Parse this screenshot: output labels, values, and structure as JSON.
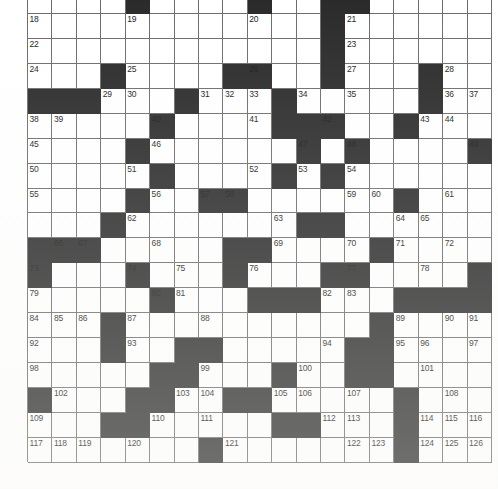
{
  "document": {
    "kind": "crossword-puzzle-grid",
    "title": "Crossword Puzzle Grid",
    "columns": 19,
    "rows": 19,
    "first_row_clipped": true,
    "colors": {
      "block": "#2b2b2b",
      "cell": "#ffffff",
      "rule": "#6d6d6d",
      "number_text": "#1b1b1b",
      "page_background": "#ffffff"
    },
    "number_range": {
      "lowest_visible": 18,
      "highest_visible": 130
    }
  },
  "grid": {
    "legend": {
      "0": "white / open cell",
      "1": "black / blocked cell"
    },
    "blocks": [
      [
        0,
        0,
        0,
        0,
        1,
        0,
        0,
        0,
        0,
        1,
        0,
        0,
        1,
        1,
        0,
        0,
        0,
        0,
        0
      ],
      [
        0,
        0,
        0,
        0,
        0,
        0,
        0,
        0,
        0,
        0,
        0,
        0,
        1,
        0,
        0,
        0,
        0,
        0,
        0
      ],
      [
        0,
        0,
        0,
        0,
        0,
        0,
        0,
        0,
        0,
        0,
        0,
        0,
        1,
        0,
        0,
        0,
        0,
        0,
        0
      ],
      [
        0,
        0,
        0,
        1,
        0,
        0,
        0,
        0,
        1,
        1,
        0,
        0,
        1,
        0,
        0,
        0,
        1,
        0,
        0
      ],
      [
        1,
        1,
        1,
        0,
        0,
        0,
        1,
        0,
        0,
        0,
        1,
        0,
        0,
        0,
        0,
        0,
        1,
        0,
        0
      ],
      [
        0,
        0,
        0,
        0,
        0,
        1,
        0,
        0,
        0,
        0,
        1,
        1,
        1,
        0,
        0,
        1,
        0,
        0,
        0
      ],
      [
        0,
        0,
        0,
        0,
        1,
        0,
        0,
        0,
        0,
        0,
        0,
        1,
        0,
        1,
        0,
        0,
        0,
        0,
        1
      ],
      [
        0,
        0,
        0,
        0,
        0,
        1,
        0,
        0,
        0,
        0,
        1,
        0,
        1,
        0,
        0,
        0,
        0,
        0,
        0
      ],
      [
        0,
        0,
        0,
        0,
        1,
        0,
        0,
        1,
        1,
        0,
        0,
        0,
        0,
        0,
        0,
        1,
        0,
        0,
        0
      ],
      [
        0,
        0,
        0,
        1,
        0,
        0,
        0,
        0,
        0,
        0,
        0,
        1,
        1,
        0,
        0,
        0,
        0,
        0,
        0
      ],
      [
        1,
        1,
        1,
        0,
        0,
        0,
        0,
        0,
        1,
        1,
        0,
        0,
        0,
        0,
        1,
        0,
        0,
        0,
        0
      ],
      [
        1,
        0,
        0,
        0,
        1,
        0,
        0,
        0,
        1,
        0,
        0,
        0,
        1,
        1,
        0,
        0,
        0,
        0,
        1
      ],
      [
        0,
        0,
        0,
        0,
        0,
        1,
        0,
        0,
        0,
        1,
        1,
        1,
        0,
        0,
        0,
        1,
        1,
        1,
        1
      ],
      [
        0,
        0,
        0,
        1,
        0,
        0,
        0,
        0,
        0,
        0,
        0,
        0,
        0,
        0,
        1,
        0,
        0,
        0,
        0
      ],
      [
        0,
        0,
        0,
        1,
        0,
        0,
        1,
        1,
        0,
        0,
        0,
        0,
        0,
        1,
        1,
        0,
        0,
        0,
        0
      ],
      [
        0,
        0,
        0,
        0,
        0,
        1,
        1,
        0,
        0,
        0,
        1,
        0,
        0,
        1,
        1,
        0,
        0,
        0,
        0
      ],
      [
        1,
        0,
        0,
        0,
        1,
        1,
        0,
        0,
        1,
        1,
        0,
        0,
        0,
        0,
        0,
        1,
        0,
        0,
        0
      ],
      [
        0,
        0,
        0,
        1,
        1,
        0,
        0,
        0,
        0,
        0,
        1,
        1,
        0,
        0,
        0,
        1,
        0,
        0,
        0
      ],
      [
        0,
        0,
        0,
        0,
        0,
        0,
        0,
        1,
        0,
        0,
        0,
        0,
        0,
        0,
        0,
        1,
        0,
        0,
        0
      ]
    ],
    "numbers": [
      [
        null,
        null,
        null,
        null,
        null,
        null,
        null,
        null,
        null,
        null,
        null,
        null,
        null,
        null,
        null,
        null,
        null,
        null,
        null
      ],
      [
        18,
        null,
        null,
        null,
        19,
        null,
        null,
        null,
        null,
        20,
        null,
        null,
        null,
        21,
        null,
        null,
        null,
        null,
        null
      ],
      [
        22,
        null,
        null,
        null,
        null,
        null,
        null,
        null,
        null,
        null,
        null,
        null,
        null,
        23,
        null,
        null,
        null,
        null,
        null
      ],
      [
        24,
        null,
        null,
        null,
        25,
        null,
        null,
        null,
        null,
        26,
        null,
        null,
        null,
        27,
        null,
        null,
        null,
        28,
        null
      ],
      [
        null,
        null,
        null,
        29,
        30,
        null,
        null,
        31,
        32,
        33,
        null,
        34,
        null,
        35,
        null,
        null,
        null,
        36,
        37
      ],
      [
        38,
        39,
        null,
        null,
        null,
        40,
        null,
        null,
        null,
        41,
        null,
        null,
        42,
        null,
        null,
        null,
        43,
        44,
        null
      ],
      [
        45,
        null,
        null,
        null,
        null,
        46,
        null,
        null,
        null,
        null,
        null,
        47,
        null,
        48,
        null,
        null,
        null,
        null,
        49
      ],
      [
        50,
        null,
        null,
        null,
        51,
        null,
        null,
        null,
        null,
        52,
        null,
        53,
        null,
        54,
        null,
        null,
        null,
        null,
        null
      ],
      [
        55,
        null,
        null,
        null,
        null,
        56,
        null,
        57,
        58,
        null,
        null,
        null,
        null,
        59,
        60,
        null,
        null,
        61,
        null
      ],
      [
        null,
        null,
        null,
        null,
        62,
        null,
        null,
        null,
        null,
        null,
        63,
        null,
        null,
        null,
        null,
        64,
        65,
        null,
        null
      ],
      [
        null,
        66,
        67,
        null,
        null,
        68,
        null,
        null,
        null,
        null,
        69,
        null,
        null,
        70,
        null,
        71,
        null,
        72,
        null
      ],
      [
        73,
        null,
        null,
        null,
        74,
        null,
        75,
        null,
        null,
        76,
        null,
        null,
        null,
        77,
        null,
        null,
        78,
        null,
        null
      ],
      [
        79,
        null,
        null,
        null,
        null,
        80,
        81,
        null,
        null,
        null,
        null,
        null,
        82,
        83,
        null,
        null,
        null,
        null,
        null
      ],
      [
        84,
        85,
        86,
        null,
        87,
        null,
        null,
        88,
        null,
        null,
        null,
        null,
        null,
        null,
        null,
        89,
        null,
        90,
        91
      ],
      [
        92,
        null,
        null,
        null,
        93,
        null,
        null,
        null,
        null,
        null,
        null,
        null,
        94,
        null,
        null,
        95,
        96,
        null,
        97
      ],
      [
        98,
        null,
        null,
        null,
        null,
        null,
        null,
        99,
        null,
        null,
        null,
        100,
        null,
        null,
        null,
        null,
        101,
        null,
        null
      ],
      [
        null,
        102,
        null,
        null,
        null,
        null,
        103,
        104,
        null,
        null,
        105,
        106,
        null,
        107,
        null,
        null,
        null,
        108,
        null
      ],
      [
        109,
        null,
        null,
        null,
        null,
        110,
        null,
        111,
        null,
        null,
        null,
        null,
        112,
        113,
        null,
        null,
        114,
        115,
        116
      ],
      [
        117,
        118,
        119,
        null,
        120,
        null,
        null,
        null,
        121,
        null,
        null,
        null,
        null,
        122,
        123,
        null,
        124,
        125,
        126
      ]
    ],
    "cells": [
      {
        "row": 0,
        "col": 4,
        "block": true
      },
      {
        "row": 0,
        "col": 9,
        "block": true
      },
      {
        "row": 0,
        "col": 12,
        "block": true
      },
      {
        "row": 0,
        "col": 13,
        "block": true
      },
      {
        "row": 1,
        "col": 0,
        "number": 18
      },
      {
        "row": 1,
        "col": 4,
        "number": 19
      },
      {
        "row": 1,
        "col": 9,
        "number": 20
      },
      {
        "row": 1,
        "col": 12,
        "block": true
      },
      {
        "row": 1,
        "col": 13,
        "number": 21
      },
      {
        "row": 2,
        "col": 0,
        "number": 22
      },
      {
        "row": 2,
        "col": 12,
        "block": true
      },
      {
        "row": 2,
        "col": 13,
        "number": 23
      },
      {
        "row": 3,
        "col": 0,
        "number": 24
      },
      {
        "row": 3,
        "col": 3,
        "block": true
      },
      {
        "row": 3,
        "col": 4,
        "number": 25
      },
      {
        "row": 3,
        "col": 8,
        "block": true
      },
      {
        "row": 3,
        "col": 9,
        "number": 26
      },
      {
        "row": 3,
        "col": 12,
        "block": true
      },
      {
        "row": 3,
        "col": 13,
        "number": 27
      },
      {
        "row": 3,
        "col": 16,
        "block": true
      },
      {
        "row": 3,
        "col": 17,
        "number": 28
      },
      {
        "row": 4,
        "col": 0,
        "block": true
      },
      {
        "row": 4,
        "col": 1,
        "block": true
      },
      {
        "row": 4,
        "col": 2,
        "block": true
      },
      {
        "row": 4,
        "col": 3,
        "number": 29
      },
      {
        "row": 4,
        "col": 4,
        "number": 30
      },
      {
        "row": 4,
        "col": 6,
        "block": true
      },
      {
        "row": 4,
        "col": 7,
        "number": 31
      },
      {
        "row": 4,
        "col": 8,
        "number": 32
      },
      {
        "row": 4,
        "col": 9,
        "number": 33
      },
      {
        "row": 4,
        "col": 10,
        "block": true
      },
      {
        "row": 4,
        "col": 11,
        "number": 34
      },
      {
        "row": 4,
        "col": 13,
        "number": 35
      },
      {
        "row": 4,
        "col": 16,
        "block": true
      },
      {
        "row": 4,
        "col": 17,
        "number": 36
      },
      {
        "row": 4,
        "col": 18,
        "number": 37
      },
      {
        "row": 5,
        "col": 0,
        "number": 38
      },
      {
        "row": 5,
        "col": 1,
        "number": 39
      },
      {
        "row": 5,
        "col": 5,
        "number": 40
      },
      {
        "row": 5,
        "col": 9,
        "number": 41
      },
      {
        "row": 5,
        "col": 12,
        "number": 42
      },
      {
        "row": 5,
        "col": 16,
        "number": 43
      },
      {
        "row": 5,
        "col": 17,
        "number": 44
      },
      {
        "row": 6,
        "col": 0,
        "number": 45
      },
      {
        "row": 6,
        "col": 5,
        "number": 46
      },
      {
        "row": 6,
        "col": 11,
        "number": 47
      },
      {
        "row": 6,
        "col": 13,
        "number": 48
      },
      {
        "row": 6,
        "col": 18,
        "number": 49
      },
      {
        "row": 7,
        "col": 0,
        "number": 50
      },
      {
        "row": 7,
        "col": 4,
        "number": 51
      },
      {
        "row": 7,
        "col": 9,
        "number": 52
      },
      {
        "row": 7,
        "col": 11,
        "number": 53
      },
      {
        "row": 7,
        "col": 13,
        "number": 54
      },
      {
        "row": 8,
        "col": 0,
        "number": 55
      },
      {
        "row": 8,
        "col": 5,
        "number": 56
      },
      {
        "row": 8,
        "col": 7,
        "number": 57
      },
      {
        "row": 8,
        "col": 8,
        "number": 58
      },
      {
        "row": 8,
        "col": 13,
        "number": 59
      },
      {
        "row": 8,
        "col": 14,
        "number": 60
      },
      {
        "row": 8,
        "col": 17,
        "number": 61
      },
      {
        "row": 9,
        "col": 4,
        "number": 62
      },
      {
        "row": 9,
        "col": 10,
        "number": 63
      },
      {
        "row": 9,
        "col": 15,
        "number": 64
      },
      {
        "row": 9,
        "col": 16,
        "number": 65
      },
      {
        "row": 10,
        "col": 1,
        "number": 66
      },
      {
        "row": 10,
        "col": 2,
        "number": 67
      },
      {
        "row": 10,
        "col": 5,
        "number": 68
      },
      {
        "row": 10,
        "col": 10,
        "number": 69
      },
      {
        "row": 10,
        "col": 13,
        "number": 70
      },
      {
        "row": 10,
        "col": 15,
        "number": 71
      },
      {
        "row": 10,
        "col": 17,
        "number": 72
      },
      {
        "row": 11,
        "col": 0,
        "number": 73
      },
      {
        "row": 11,
        "col": 4,
        "number": 74
      },
      {
        "row": 11,
        "col": 6,
        "number": 75
      },
      {
        "row": 11,
        "col": 9,
        "number": 76
      },
      {
        "row": 11,
        "col": 13,
        "number": 77
      },
      {
        "row": 11,
        "col": 16,
        "number": 78
      },
      {
        "row": 12,
        "col": 0,
        "number": 79
      },
      {
        "row": 12,
        "col": 5,
        "number": 80
      },
      {
        "row": 12,
        "col": 6,
        "number": 81
      },
      {
        "row": 12,
        "col": 12,
        "number": 82
      },
      {
        "row": 12,
        "col": 13,
        "number": 83
      },
      {
        "row": 13,
        "col": 0,
        "number": 84
      },
      {
        "row": 13,
        "col": 1,
        "number": 85
      },
      {
        "row": 13,
        "col": 2,
        "number": 86
      },
      {
        "row": 13,
        "col": 4,
        "number": 87
      },
      {
        "row": 13,
        "col": 7,
        "number": 88
      },
      {
        "row": 13,
        "col": 15,
        "number": 89
      },
      {
        "row": 13,
        "col": 17,
        "number": 90
      },
      {
        "row": 13,
        "col": 18,
        "number": 91
      },
      {
        "row": 14,
        "col": 0,
        "number": 92
      },
      {
        "row": 14,
        "col": 4,
        "number": 93
      },
      {
        "row": 14,
        "col": 12,
        "number": 94
      },
      {
        "row": 14,
        "col": 15,
        "number": 95
      },
      {
        "row": 14,
        "col": 16,
        "number": 96
      },
      {
        "row": 14,
        "col": 18,
        "number": 97
      },
      {
        "row": 15,
        "col": 0,
        "number": 98
      },
      {
        "row": 15,
        "col": 7,
        "number": 99
      },
      {
        "row": 15,
        "col": 11,
        "number": 100
      },
      {
        "row": 15,
        "col": 16,
        "number": 101
      },
      {
        "row": 16,
        "col": 1,
        "number": 102
      },
      {
        "row": 16,
        "col": 6,
        "number": 103
      },
      {
        "row": 16,
        "col": 7,
        "number": 104
      },
      {
        "row": 16,
        "col": 10,
        "number": 105
      },
      {
        "row": 16,
        "col": 11,
        "number": 106
      },
      {
        "row": 16,
        "col": 13,
        "number": 107
      },
      {
        "row": 16,
        "col": 17,
        "number": 108
      },
      {
        "row": 17,
        "col": 0,
        "number": 109
      },
      {
        "row": 17,
        "col": 5,
        "number": 110
      },
      {
        "row": 17,
        "col": 7,
        "number": 111
      },
      {
        "row": 17,
        "col": 12,
        "number": 112
      },
      {
        "row": 17,
        "col": 13,
        "number": 113
      },
      {
        "row": 17,
        "col": 16,
        "number": 114
      },
      {
        "row": 17,
        "col": 17,
        "number": 115
      },
      {
        "row": 17,
        "col": 18,
        "number": 116
      },
      {
        "row": 18,
        "col": 0,
        "number": 117
      },
      {
        "row": 18,
        "col": 1,
        "number": 118
      },
      {
        "row": 18,
        "col": 2,
        "number": 119
      },
      {
        "row": 18,
        "col": 4,
        "number": 120
      },
      {
        "row": 18,
        "col": 8,
        "number": 121
      },
      {
        "row": 18,
        "col": 13,
        "number": 122
      },
      {
        "row": 18,
        "col": 14,
        "number": 123
      },
      {
        "row": 18,
        "col": 16,
        "number": 124
      },
      {
        "row": 18,
        "col": 17,
        "number": 125
      },
      {
        "row": 18,
        "col": 18,
        "number": 126
      }
    ]
  }
}
